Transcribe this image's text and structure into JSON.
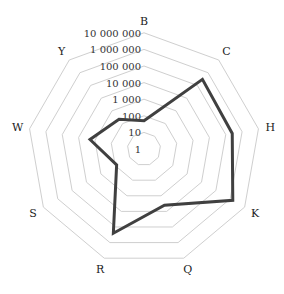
{
  "chart_data": {
    "type": "radar",
    "title": "",
    "scale": "log10",
    "axes": [
      "B",
      "C",
      "H",
      "K",
      "Q",
      "R",
      "S",
      "W",
      "Y"
    ],
    "tick_labels": [
      "1",
      "10",
      "100",
      "1 000",
      "10 000",
      "100 000",
      "1 000 000",
      "10 000 000"
    ],
    "tick_values": [
      1,
      10,
      100,
      1000,
      10000,
      100000,
      1000000,
      10000000
    ],
    "range": [
      1,
      10000000
    ],
    "grid": true,
    "series": [
      {
        "name": "",
        "color": "#404040",
        "values": [
          50,
          300000,
          250000,
          1500000,
          4000,
          250000,
          80,
          2000,
          220
        ]
      }
    ],
    "legend": {
      "position": "bottom",
      "entries_visible": false,
      "note": "legend clipped at bottom edge"
    }
  }
}
